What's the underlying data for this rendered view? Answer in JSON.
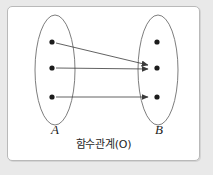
{
  "figure": {
    "caption": "함수관계(O)",
    "panel_background": "#ffffff",
    "outer_background": "#e9e9e9",
    "border_color": "#b9b9b9",
    "ink_color": "#1c1c1c"
  },
  "sets": [
    {
      "id": "A",
      "label": "A",
      "side": "left",
      "ellipse": {
        "cx": 55,
        "cy": 70,
        "rx": 20,
        "ry": 55
      },
      "elements": [
        {
          "id": "a1",
          "cx": 52,
          "cy": 42
        },
        {
          "id": "a2",
          "cx": 52,
          "cy": 68
        },
        {
          "id": "a3",
          "cx": 52,
          "cy": 97
        }
      ]
    },
    {
      "id": "B",
      "label": "B",
      "side": "right",
      "ellipse": {
        "cx": 158,
        "cy": 70,
        "rx": 20,
        "ry": 55
      },
      "elements": [
        {
          "id": "b1",
          "cx": 157,
          "cy": 42
        },
        {
          "id": "b2",
          "cx": 157,
          "cy": 68
        },
        {
          "id": "b3",
          "cx": 157,
          "cy": 97
        }
      ]
    }
  ],
  "mappings": [
    {
      "from": "a1",
      "to": "b2",
      "x1": 56,
      "y1": 43,
      "x2": 148,
      "y2": 65
    },
    {
      "from": "a2",
      "to": "b2",
      "x1": 56,
      "y1": 68,
      "x2": 148,
      "y2": 69
    },
    {
      "from": "a3",
      "to": "b3",
      "x1": 56,
      "y1": 97,
      "x2": 148,
      "y2": 97
    }
  ],
  "legend": {
    "dot_radius": 2.6,
    "arrow_color": "#3a3a3a",
    "ellipse_stroke": "#6e6e6e"
  }
}
